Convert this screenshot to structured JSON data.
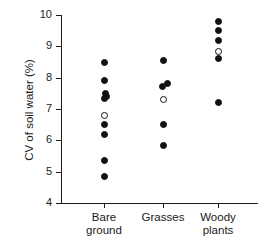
{
  "chart_data": {
    "type": "scatter",
    "title": "",
    "xlabel": "",
    "ylabel": "CV of soil water (%)",
    "ylim": [
      4,
      10
    ],
    "yticks": [
      4,
      5,
      6,
      7,
      8,
      9,
      10
    ],
    "ytick_labels": [
      "4",
      "5",
      "6",
      "7",
      "8",
      "9",
      "10"
    ],
    "grid": false,
    "legend": "none",
    "categories": [
      "Bare ground",
      "Grasses",
      "Woody plants"
    ],
    "category_labels": [
      {
        "line1": "Bare",
        "line2": "ground"
      },
      {
        "line1": "Grasses",
        "line2": ""
      },
      {
        "line1": "Woody",
        "line2": "plants"
      }
    ],
    "marker_styles": {
      "closed": "filled-circle",
      "open": "open-circle"
    },
    "series": [
      {
        "name": "Bare ground",
        "category_index": 0,
        "points": [
          {
            "value": 8.5,
            "marker": "closed"
          },
          {
            "value": 7.9,
            "marker": "closed"
          },
          {
            "value": 7.5,
            "marker": "closed",
            "xoffset": 1
          },
          {
            "value": 7.4,
            "marker": "closed",
            "xoffset": 2
          },
          {
            "value": 7.35,
            "marker": "closed",
            "xoffset": 0
          },
          {
            "value": 6.8,
            "marker": "open"
          },
          {
            "value": 6.5,
            "marker": "closed"
          },
          {
            "value": 6.2,
            "marker": "closed"
          },
          {
            "value": 5.35,
            "marker": "closed"
          },
          {
            "value": 4.85,
            "marker": "closed"
          }
        ]
      },
      {
        "name": "Grasses",
        "category_index": 1,
        "points": [
          {
            "value": 8.55,
            "marker": "closed"
          },
          {
            "value": 7.8,
            "marker": "closed",
            "xoffset": 4
          },
          {
            "value": 7.72,
            "marker": "closed",
            "xoffset": -1
          },
          {
            "value": 7.3,
            "marker": "open"
          },
          {
            "value": 6.5,
            "marker": "closed"
          },
          {
            "value": 5.83,
            "marker": "closed"
          }
        ]
      },
      {
        "name": "Woody plants",
        "category_index": 2,
        "points": [
          {
            "value": 9.78,
            "marker": "closed"
          },
          {
            "value": 9.5,
            "marker": "closed"
          },
          {
            "value": 9.2,
            "marker": "closed"
          },
          {
            "value": 8.85,
            "marker": "open"
          },
          {
            "value": 8.6,
            "marker": "closed"
          },
          {
            "value": 7.2,
            "marker": "closed"
          }
        ]
      }
    ]
  },
  "colors": {
    "axis": "#1a1a1a",
    "marker_fill": "#111111",
    "marker_open_fill": "#ffffff",
    "background": "#ffffff"
  }
}
